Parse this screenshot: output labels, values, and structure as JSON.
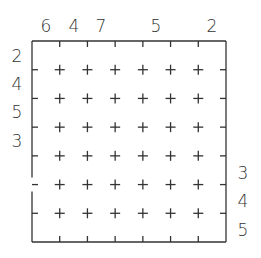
{
  "puzzle": {
    "rows": 7,
    "cols": 7,
    "top_clues": [
      "6",
      "4",
      "7",
      "",
      "5",
      "",
      "2"
    ],
    "left_clues": [
      "2",
      "4",
      "5",
      "3",
      "",
      "",
      ""
    ],
    "right_clues": [
      "",
      "",
      "",
      "",
      "3",
      "4",
      "5"
    ],
    "wall_openings": [
      {
        "side": "left",
        "between_rows": [
          4,
          5
        ]
      }
    ],
    "line_color": "#333333"
  }
}
